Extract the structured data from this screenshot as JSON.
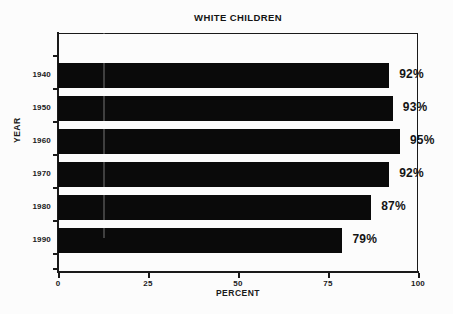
{
  "chart_data": {
    "type": "bar",
    "orientation": "horizontal",
    "title": "WHITE CHILDREN",
    "xlabel": "PERCENT",
    "ylabel": "YEAR",
    "categories": [
      "1940",
      "1950",
      "1960",
      "1970",
      "1980",
      "1990"
    ],
    "values": [
      92,
      93,
      95,
      92,
      87,
      79
    ],
    "value_labels": [
      "92%",
      "93%",
      "95%",
      "92%",
      "87%",
      "79%"
    ],
    "xlim": [
      0,
      100
    ],
    "xticks": [
      0,
      25,
      50,
      75,
      100
    ],
    "xtick_labels": [
      "0",
      "25",
      "50",
      "75",
      "100"
    ],
    "grid": false,
    "legend": null,
    "bar_color": "#0a0a0a",
    "axis_color": "#1a1a1a",
    "background": "#fcfcfc"
  }
}
